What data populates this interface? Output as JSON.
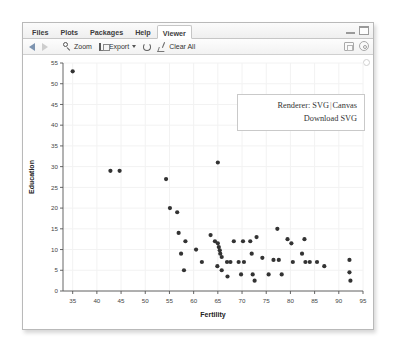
{
  "window": {
    "tabs": [
      {
        "label": "Files",
        "active": false
      },
      {
        "label": "Plots",
        "active": false
      },
      {
        "label": "Packages",
        "active": false
      },
      {
        "label": "Help",
        "active": false
      },
      {
        "label": "Viewer",
        "active": true
      }
    ],
    "controls": {
      "minimize": "minimize-icon",
      "maximize": "maximize-icon"
    }
  },
  "toolbar": {
    "back_icon": "back-arrow-icon",
    "forward_icon": "forward-arrow-icon",
    "zoom_label": "Zoom",
    "zoom_icon": "magnifier-icon",
    "export_label": "Export",
    "export_icon": "export-icon",
    "export_caret": "chevron-down-icon",
    "refresh_icon": "refresh-icon",
    "clear_label": "Clear All",
    "clear_icon": "broom-icon",
    "publish_icon": "publish-icon",
    "settings_icon": "gear-icon"
  },
  "renderer": {
    "label": "Renderer:",
    "svg_option": "SVG",
    "separator": "|",
    "canvas_option": "Canvas",
    "download_link": "Download SVG"
  },
  "colors": {
    "point": "#333333",
    "axis": "#555555",
    "grid": "#f2f2f2",
    "panel": "#ffffff",
    "accent": "#7d94b0"
  },
  "chart_data": {
    "type": "scatter",
    "title": "",
    "xlabel": "Fertility",
    "ylabel": "Education",
    "xlim": [
      33,
      95
    ],
    "ylim": [
      0,
      55
    ],
    "xticks": [
      35,
      40,
      45,
      50,
      55,
      60,
      65,
      70,
      75,
      80,
      85,
      90,
      95
    ],
    "yticks": [
      0,
      5,
      10,
      15,
      20,
      25,
      30,
      35,
      40,
      45,
      50,
      55
    ],
    "grid": true,
    "legend": "none",
    "series": [
      {
        "name": "Swiss provinces",
        "points": [
          [
            35.0,
            53.0
          ],
          [
            42.8,
            29.0
          ],
          [
            44.7,
            29.0
          ],
          [
            54.3,
            27.0
          ],
          [
            55.1,
            20.0
          ],
          [
            56.6,
            19.0
          ],
          [
            58.3,
            12.0
          ],
          [
            57.4,
            9.0
          ],
          [
            61.7,
            7.0
          ],
          [
            60.5,
            10.0
          ],
          [
            56.9,
            14.0
          ],
          [
            58.0,
            5.0
          ],
          [
            64.4,
            12.0
          ],
          [
            64.9,
            6.0
          ],
          [
            65.0,
            11.5
          ],
          [
            65.2,
            10.6
          ],
          [
            65.4,
            9.8
          ],
          [
            65.5,
            9.0
          ],
          [
            65.8,
            8.2
          ],
          [
            66.9,
            7.0
          ],
          [
            67.6,
            7.0
          ],
          [
            65.8,
            5.0
          ],
          [
            67.0,
            3.5
          ],
          [
            63.5,
            13.5
          ],
          [
            65.0,
            31.0
          ],
          [
            68.3,
            12.0
          ],
          [
            69.3,
            7.0
          ],
          [
            70.4,
            7.0
          ],
          [
            70.2,
            12.0
          ],
          [
            69.8,
            4.0
          ],
          [
            71.7,
            12.0
          ],
          [
            72.0,
            9.0
          ],
          [
            72.2,
            4.0
          ],
          [
            72.6,
            2.5
          ],
          [
            73.0,
            13.0
          ],
          [
            74.2,
            8.0
          ],
          [
            75.5,
            4.0
          ],
          [
            76.5,
            7.5
          ],
          [
            77.3,
            15.0
          ],
          [
            77.6,
            7.5
          ],
          [
            78.2,
            4.0
          ],
          [
            79.4,
            12.5
          ],
          [
            80.2,
            11.5
          ],
          [
            80.5,
            7.0
          ],
          [
            82.4,
            9.0
          ],
          [
            82.9,
            12.5
          ],
          [
            83.1,
            7.0
          ],
          [
            84.0,
            7.0
          ],
          [
            85.5,
            7.0
          ],
          [
            87.0,
            6.0
          ],
          [
            92.2,
            7.5
          ],
          [
            92.2,
            4.5
          ],
          [
            92.4,
            2.5
          ]
        ]
      }
    ]
  }
}
